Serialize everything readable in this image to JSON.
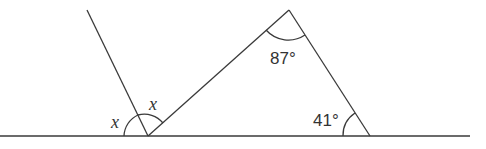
{
  "diagram": {
    "type": "geometry-angles",
    "stroke_color": "#3a3a3a",
    "labels": {
      "x_left": "x",
      "x_right": "x",
      "apex_angle": "87°",
      "base_angle": "41°"
    }
  }
}
